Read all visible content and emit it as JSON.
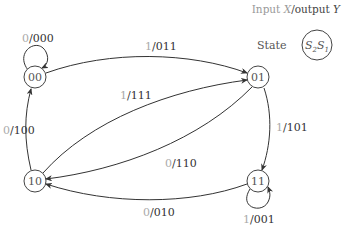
{
  "legend": {
    "header_input": "Input ",
    "header_x": "X",
    "header_sep": "/",
    "header_output": "output ",
    "header_y": "Y",
    "state_label": "State",
    "state_symbol_s2": "S",
    "state_sub_2": "2",
    "state_symbol_s1": "S",
    "state_sub_1": "1"
  },
  "states": [
    {
      "id": "00",
      "label": "00"
    },
    {
      "id": "01",
      "label": "01"
    },
    {
      "id": "10",
      "label": "10"
    },
    {
      "id": "11",
      "label": "11"
    }
  ],
  "transitions": [
    {
      "from": "00",
      "to": "00",
      "input": "0",
      "output": "000"
    },
    {
      "from": "00",
      "to": "01",
      "input": "1",
      "output": "011"
    },
    {
      "from": "10",
      "to": "01",
      "input": "1",
      "output": "111"
    },
    {
      "from": "01",
      "to": "10",
      "input": "0",
      "output": "110"
    },
    {
      "from": "10",
      "to": "00",
      "input": "0",
      "output": "100"
    },
    {
      "from": "01",
      "to": "11",
      "input": "1",
      "output": "101"
    },
    {
      "from": "11",
      "to": "10",
      "input": "0",
      "output": "010"
    },
    {
      "from": "11",
      "to": "11",
      "input": "1",
      "output": "001"
    }
  ]
}
